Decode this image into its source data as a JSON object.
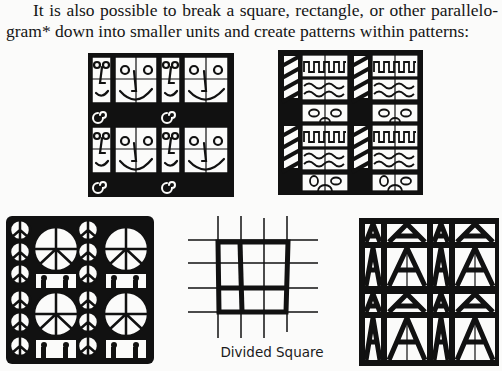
{
  "text": {
    "line1": "It is also possible to break a square, rectangle, or other parallelo-",
    "line2": "gram* down into smaller units and create patterns within patterns:"
  },
  "figures": [
    {
      "id": "faces-pattern",
      "description": "Square divided into grid with cartoon face motifs and spiral glyphs on black bands"
    },
    {
      "id": "waves-pattern",
      "description": "Square divided into grid with diagonal stripes, square waves, wavy lines, and oval eye motifs"
    },
    {
      "id": "peace-pattern",
      "description": "Square of peace symbols and small figure silhouettes in white on black"
    },
    {
      "id": "divided-square",
      "description": "Grid of thin lines with a bold outlined square subdivided into smaller units",
      "caption": "Divided Square"
    },
    {
      "id": "triangles-pattern",
      "description": "Square of stylized A-shaped triangle motifs in white on black"
    }
  ],
  "colors": {
    "ink": "#111111",
    "paper": "#fbfbfa"
  }
}
